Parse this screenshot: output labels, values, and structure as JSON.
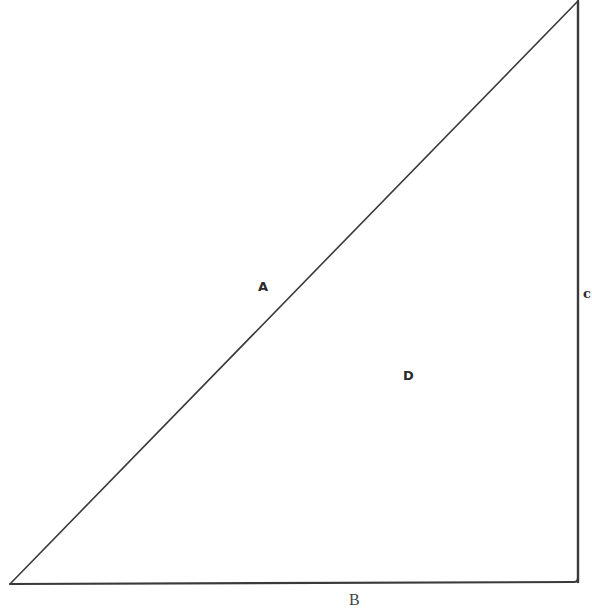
{
  "diagram": {
    "type": "right-triangle",
    "vertices": {
      "bottom_left": [
        10,
        584
      ],
      "bottom_right": [
        578,
        582
      ],
      "top_right": [
        578,
        1
      ]
    },
    "stroke_color": "#3a3a3a",
    "labels": {
      "hypotenuse": "A",
      "base": "B",
      "vertical_side": "c",
      "interior": "D"
    }
  }
}
